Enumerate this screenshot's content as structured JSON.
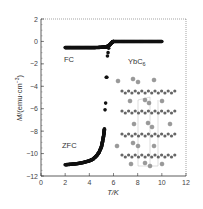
{
  "chart_data": {
    "type": "scatter",
    "title": "",
    "xlabel": "T/K",
    "ylabel": "M/(emu·cm⁻³)",
    "xlim": [
      0,
      12
    ],
    "ylim": [
      -12,
      2
    ],
    "xticks": [
      "0",
      "2",
      "4",
      "6",
      "8",
      "10",
      "12"
    ],
    "yticks": [
      "2",
      "0",
      "-2",
      "-4",
      "-6",
      "-8",
      "-10",
      "-12"
    ],
    "grid": false,
    "legend": null,
    "annotations": [
      "FC",
      "ZFC",
      "YbC6"
    ],
    "inset": "YbC6 crystal structure (layered graphite sheets with intercalated Yb atoms)",
    "series": [
      {
        "name": "FC",
        "x": [
          2.0,
          2.5,
          3.0,
          3.5,
          4.0,
          4.5,
          5.0,
          5.3,
          5.5,
          5.7,
          5.9,
          6.0,
          6.5,
          7.0,
          7.5,
          8.0,
          8.5,
          9.0,
          9.5,
          10.0
        ],
        "y": [
          -0.55,
          -0.55,
          -0.55,
          -0.55,
          -0.55,
          -0.55,
          -0.52,
          -0.5,
          -0.45,
          -0.3,
          -0.05,
          0.0,
          0.0,
          0.0,
          0.0,
          0.0,
          0.0,
          0.0,
          0.0,
          0.0
        ]
      },
      {
        "name": "ZFC",
        "x": [
          2.0,
          2.5,
          3.0,
          3.5,
          4.0,
          4.3,
          4.6,
          4.8,
          5.0,
          5.1,
          5.2,
          5.25,
          5.3,
          5.35,
          5.4,
          5.45,
          5.5,
          5.55,
          5.6
        ],
        "y": [
          -11.0,
          -10.95,
          -10.9,
          -10.8,
          -10.65,
          -10.5,
          -10.2,
          -9.9,
          -9.4,
          -8.9,
          -8.3,
          -7.8,
          -6.1,
          -5.5,
          -3.2,
          -3.2,
          -1.3,
          -1.0,
          -0.6
        ]
      }
    ]
  }
}
